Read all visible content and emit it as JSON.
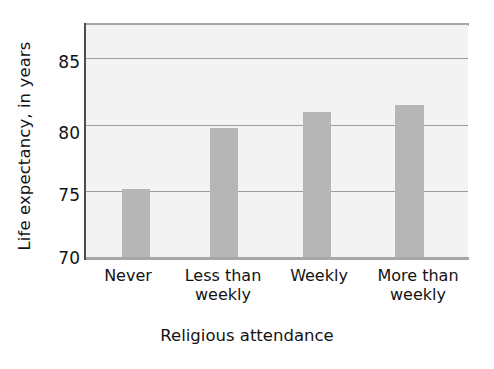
{
  "chart_data": {
    "type": "bar",
    "title": "",
    "xlabel": "Religious attendance",
    "ylabel": "Life expectancy, in years",
    "categories": [
      "Never",
      "Less than weekly",
      "Weekly",
      "More than weekly"
    ],
    "values": [
      75.2,
      79.8,
      81.0,
      81.5
    ],
    "ylim": [
      70,
      87.5
    ],
    "yticks": [
      70,
      75,
      80,
      85
    ],
    "ytick_labels": [
      "70",
      "75",
      "80",
      "85"
    ],
    "gridlines": [
      75,
      80,
      85
    ],
    "grid": true,
    "legend": "none",
    "bar_color": "#b6b6b6",
    "plot_background": "#f3f3f3",
    "grid_color": "#9d9d9d",
    "axis_color": "#4d4d4d"
  },
  "axis": {
    "y_title": "Life expectancy, in years",
    "x_title": "Religious attendance",
    "y_ticks": [
      {
        "label": "85"
      },
      {
        "label": "80"
      },
      {
        "label": "75"
      },
      {
        "label": "70"
      }
    ],
    "x_ticks": [
      {
        "line1": "Never",
        "line2": ""
      },
      {
        "line1": "Less than",
        "line2": "weekly"
      },
      {
        "line1": "Weekly",
        "line2": ""
      },
      {
        "line1": "More than",
        "line2": "weekly"
      }
    ]
  }
}
